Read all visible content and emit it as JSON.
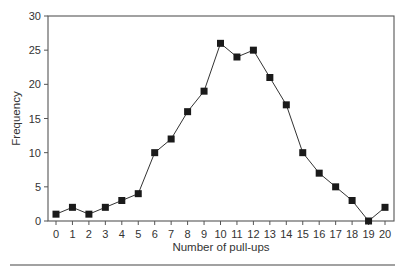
{
  "chart_data": {
    "type": "line",
    "title": "",
    "xlabel": "Number of pull-ups",
    "ylabel": "Frequency",
    "x": [
      0,
      1,
      2,
      3,
      4,
      5,
      6,
      7,
      8,
      9,
      10,
      11,
      12,
      13,
      14,
      15,
      16,
      17,
      18,
      19,
      20
    ],
    "series": [
      {
        "name": "Frequency",
        "values": [
          1,
          2,
          1,
          2,
          3,
          4,
          10,
          12,
          16,
          19,
          26,
          24,
          25,
          21,
          17,
          10,
          7,
          5,
          3,
          0,
          2
        ],
        "marker": "square",
        "color": "#1a1a1a"
      }
    ],
    "xlim": [
      0,
      20
    ],
    "ylim": [
      0,
      30
    ],
    "yticks": [
      0,
      5,
      10,
      15,
      20,
      25,
      30
    ],
    "xticks": [
      0,
      1,
      2,
      3,
      4,
      5,
      6,
      7,
      8,
      9,
      10,
      11,
      12,
      13,
      14,
      15,
      16,
      17,
      18,
      19,
      20
    ],
    "grid": false,
    "legend": "none"
  },
  "layout": {
    "frame": {
      "left": 48,
      "right": 394,
      "top": 16,
      "bottom": 221
    },
    "x_first_px": 56,
    "x_last_px": 385,
    "rule_y": 265,
    "colors": {
      "axis": "#555555",
      "line": "#333333",
      "marker": "#1a1a1a"
    }
  }
}
